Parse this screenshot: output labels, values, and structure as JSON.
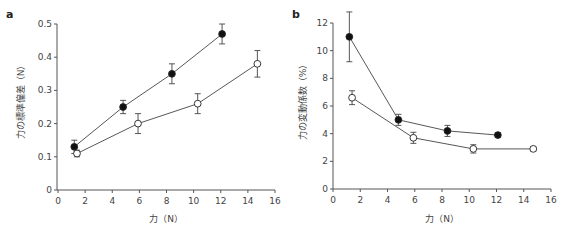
{
  "chart_data": [
    {
      "panel": "a",
      "type": "line",
      "title": "",
      "xlabel": "力（N）",
      "ylabel": "力の標準偏差（N）",
      "xlim": [
        0,
        16
      ],
      "ylim": [
        0,
        0.5
      ],
      "xticks": [
        0,
        2,
        4,
        6,
        8,
        10,
        12,
        14,
        16
      ],
      "yticks": [
        0,
        0.1,
        0.2,
        0.3,
        0.4,
        0.5
      ],
      "ytick_labels": [
        "0",
        "0.1",
        "0.2",
        "0.3",
        "0.4",
        "0.5"
      ],
      "grid": false,
      "legend": null,
      "series": [
        {
          "name": "filled",
          "marker": "filled-circle",
          "x": [
            1.2,
            4.8,
            8.4,
            12.1
          ],
          "y": [
            0.13,
            0.25,
            0.35,
            0.47
          ],
          "err": [
            0.02,
            0.02,
            0.03,
            0.03
          ]
        },
        {
          "name": "open",
          "marker": "open-circle",
          "x": [
            1.4,
            5.9,
            10.3,
            14.7
          ],
          "y": [
            0.11,
            0.2,
            0.26,
            0.38
          ],
          "err": [
            0.01,
            0.03,
            0.03,
            0.04
          ]
        }
      ]
    },
    {
      "panel": "b",
      "type": "line",
      "title": "",
      "xlabel": "力（N）",
      "ylabel": "力の変動係数（%）",
      "xlim": [
        0,
        16
      ],
      "ylim": [
        0,
        12
      ],
      "xticks": [
        0,
        2,
        4,
        6,
        8,
        10,
        12,
        14,
        16
      ],
      "yticks": [
        0,
        2,
        4,
        6,
        8,
        10,
        12
      ],
      "ytick_labels": [
        "0",
        "2",
        "4",
        "6",
        "8",
        "10",
        "12"
      ],
      "grid": false,
      "legend": null,
      "series": [
        {
          "name": "filled",
          "marker": "filled-circle",
          "x": [
            1.2,
            4.8,
            8.4,
            12.1
          ],
          "y": [
            11.0,
            5.0,
            4.2,
            3.9
          ],
          "err": [
            1.8,
            0.4,
            0.4,
            0.15
          ]
        },
        {
          "name": "open",
          "marker": "open-circle",
          "x": [
            1.4,
            5.9,
            10.3,
            14.7
          ],
          "y": [
            6.6,
            3.7,
            2.9,
            2.9
          ],
          "err": [
            0.5,
            0.4,
            0.3,
            0.15
          ]
        }
      ]
    }
  ],
  "panels": {
    "a": {
      "label": "a",
      "xlabel": "力（N）",
      "ylabel": "力の標準偏差（N）"
    },
    "b": {
      "label": "b",
      "xlabel": "力（N）",
      "ylabel": "力の変動係数（%）"
    }
  }
}
